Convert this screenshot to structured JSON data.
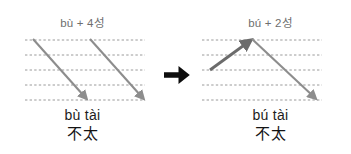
{
  "figure": {
    "type": "tone-sandhi-diagram",
    "background_color": "#ffffff",
    "transition_icon": "right-arrow-icon"
  },
  "colors": {
    "staff_line": "#9a9a9a",
    "falling_tone_arrow": "#8d8d8d",
    "rising_tone_arrow": "#6b6b6b",
    "transition_arrow": "#0d0d0d",
    "label_text": "#6e6e6e",
    "reading_text": "#1c1c1c"
  },
  "panels": {
    "before": {
      "tone_label": "bù + 4성",
      "pinyin": "bù tài",
      "hanzi": "不太",
      "staff_lines": 5,
      "contours": [
        {
          "name": "falling-tone-contour-1",
          "tone": "4",
          "direction": "falling",
          "from_line": 1,
          "to_line": 5
        },
        {
          "name": "falling-tone-contour-2",
          "tone": "4",
          "direction": "falling",
          "from_line": 1,
          "to_line": 5
        }
      ]
    },
    "after": {
      "tone_label": "bú + 2성",
      "pinyin": "bú tài",
      "hanzi": "不太",
      "staff_lines": 5,
      "contours": [
        {
          "name": "rising-tone-contour",
          "tone": "2",
          "direction": "rising",
          "from_line": 3,
          "to_line": 1
        },
        {
          "name": "falling-tone-contour",
          "tone": "4",
          "direction": "falling",
          "from_line": 1,
          "to_line": 5
        }
      ]
    }
  }
}
